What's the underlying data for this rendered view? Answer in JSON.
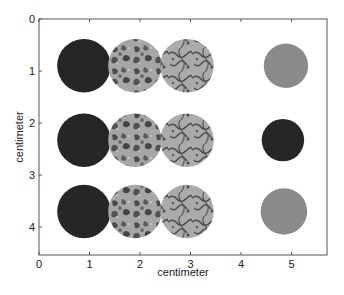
{
  "chart_data": {
    "type": "heatmap",
    "title": "",
    "xlabel": "centimeter",
    "ylabel": "centimeter",
    "xlim": [
      0,
      5.7
    ],
    "ylim": [
      0,
      4.55
    ],
    "y_axis_inverted": true,
    "grid": false,
    "legend": null,
    "xticks": [
      "0",
      "1",
      "2",
      "3",
      "4",
      "5"
    ],
    "yticks": [
      "0",
      "1",
      "2",
      "3",
      "4"
    ],
    "spots": [
      {
        "row": 1,
        "col": 1,
        "x": 0.89,
        "y": 0.9,
        "r": 0.53,
        "texture": "uniform",
        "tone": "dark"
      },
      {
        "row": 1,
        "col": 2,
        "x": 1.9,
        "y": 0.9,
        "r": 0.53,
        "texture": "mottled",
        "tone": "light-gray with dark patches"
      },
      {
        "row": 1,
        "col": 3,
        "x": 2.93,
        "y": 0.9,
        "r": 0.53,
        "texture": "veined",
        "tone": "light-gray with dark veins"
      },
      {
        "row": 1,
        "col": 4,
        "x": 4.89,
        "y": 0.9,
        "r": 0.44,
        "texture": "uniform",
        "tone": "medium-gray"
      },
      {
        "row": 2,
        "col": 1,
        "x": 0.89,
        "y": 2.33,
        "r": 0.53,
        "texture": "uniform",
        "tone": "dark"
      },
      {
        "row": 2,
        "col": 2,
        "x": 1.9,
        "y": 2.33,
        "r": 0.53,
        "texture": "mottled",
        "tone": "gray with dark patches"
      },
      {
        "row": 2,
        "col": 3,
        "x": 2.93,
        "y": 2.33,
        "r": 0.53,
        "texture": "veined",
        "tone": "light-gray with dark veins"
      },
      {
        "row": 2,
        "col": 4,
        "x": 4.83,
        "y": 2.33,
        "r": 0.42,
        "texture": "uniform",
        "tone": "dark"
      },
      {
        "row": 3,
        "col": 1,
        "x": 0.89,
        "y": 3.7,
        "r": 0.53,
        "texture": "uniform",
        "tone": "dark"
      },
      {
        "row": 3,
        "col": 2,
        "x": 1.9,
        "y": 3.7,
        "r": 0.53,
        "texture": "mottled",
        "tone": "light-gray with dark patches"
      },
      {
        "row": 3,
        "col": 3,
        "x": 2.93,
        "y": 3.7,
        "r": 0.53,
        "texture": "veined",
        "tone": "light-gray with dark veins"
      },
      {
        "row": 3,
        "col": 4,
        "x": 4.85,
        "y": 3.7,
        "r": 0.46,
        "texture": "uniform",
        "tone": "medium-gray"
      }
    ]
  },
  "colors": {
    "background": "#ffffff",
    "axis": "#555555",
    "dark": "#262626",
    "medium": "#8a8a8a",
    "light": "#a9a9a9",
    "patch": "#4a4a4a"
  }
}
